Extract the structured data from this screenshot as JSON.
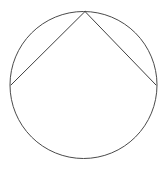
{
  "figure": {
    "name": "circle-with-inscribed-angle",
    "background_color": "#ffffff",
    "stroke_color": "#4a4a4a",
    "chord_color": "#3f3f3f",
    "stroke_width": 1,
    "canvas": {
      "width": 166,
      "height": 176
    },
    "circle": {
      "label": "circle",
      "center_x": 83.5,
      "center_y": 85,
      "radius": 73.5
    },
    "points": [
      {
        "label": "apex-point",
        "x": 85,
        "y": 11.5
      },
      {
        "label": "left-point",
        "x": 11,
        "y": 85
      },
      {
        "label": "right-point",
        "x": 156,
        "y": 85
      }
    ],
    "chords": [
      {
        "label": "left-chord",
        "x1": 85,
        "y1": 11.5,
        "x2": 11,
        "y2": 85
      },
      {
        "label": "right-chord",
        "x1": 85,
        "y1": 11.5,
        "x2": 156,
        "y2": 85
      }
    ],
    "labels": []
  }
}
